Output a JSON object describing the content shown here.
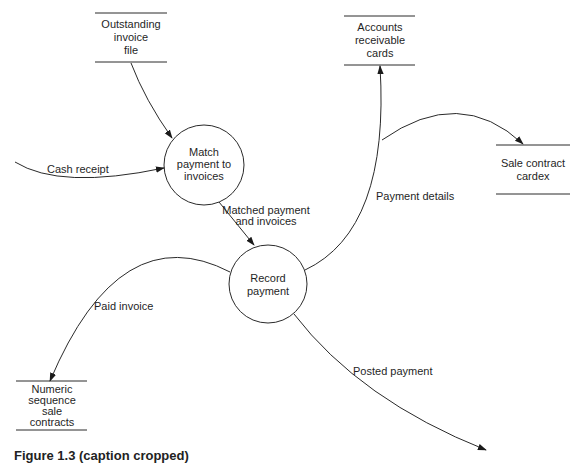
{
  "diagram": {
    "type": "data-flow-diagram",
    "processes": [
      {
        "id": "p1",
        "label_lines": [
          "Match",
          "payment to",
          "invoices"
        ],
        "cx": 204,
        "cy": 165,
        "r": 40
      },
      {
        "id": "p2",
        "label_lines": [
          "Record",
          "payment"
        ],
        "cx": 268,
        "cy": 284,
        "r": 39
      }
    ],
    "data_stores": [
      {
        "id": "s1",
        "label_lines": [
          "Outstanding",
          "invoice",
          "file"
        ],
        "x1": 95,
        "x2": 167,
        "top": 13,
        "bottom": 62
      },
      {
        "id": "s2",
        "label_lines": [
          "Accounts",
          "receivable",
          "cards"
        ],
        "x1": 344,
        "x2": 415,
        "top": 16,
        "bottom": 65
      },
      {
        "id": "s3",
        "label_lines": [
          "Sale contract",
          "cardex"
        ],
        "x1": 496,
        "x2": 570,
        "top": 145,
        "bottom": 194
      },
      {
        "id": "s4",
        "label_lines": [
          "Numeric",
          "sequence",
          "sale",
          "contracts"
        ],
        "x1": 16,
        "x2": 87,
        "top": 381,
        "bottom": 430
      }
    ],
    "flows": [
      {
        "id": "f1",
        "from": "external",
        "to": "p1",
        "label": "Cash receipt"
      },
      {
        "id": "f2",
        "from": "s1",
        "to": "p1",
        "label": ""
      },
      {
        "id": "f3",
        "from": "p1",
        "to": "p2",
        "label_lines": [
          "Matched payment",
          "and invoices"
        ]
      },
      {
        "id": "f4",
        "from": "p2",
        "to": "s2",
        "label": "Payment details"
      },
      {
        "id": "f5",
        "from": "p2",
        "to": "s3",
        "label": ""
      },
      {
        "id": "f6",
        "from": "p2",
        "to": "s4",
        "label": "Paid invoice"
      },
      {
        "id": "f7",
        "from": "p2",
        "to": "external",
        "label": "Posted payment"
      }
    ]
  },
  "labels": {
    "p1": [
      "Match",
      "payment to",
      "invoices"
    ],
    "p2": [
      "Record",
      "payment"
    ],
    "s1": [
      "Outstanding",
      "invoice",
      "file"
    ],
    "s2": [
      "Accounts",
      "receivable",
      "cards"
    ],
    "s3": [
      "Sale contract",
      "cardex"
    ],
    "s4": [
      "Numeric",
      "sequence",
      "sale",
      "contracts"
    ],
    "cash_receipt": "Cash receipt",
    "matched_1": "Matched payment",
    "matched_2": "and invoices",
    "payment_details": "Payment details",
    "paid_invoice": "Paid invoice",
    "posted_payment": "Posted payment"
  },
  "caption": {
    "text": "Figure 1.3  (caption cropped)"
  },
  "colors": {
    "line": "#2a2a2a",
    "background": "#ffffff"
  }
}
